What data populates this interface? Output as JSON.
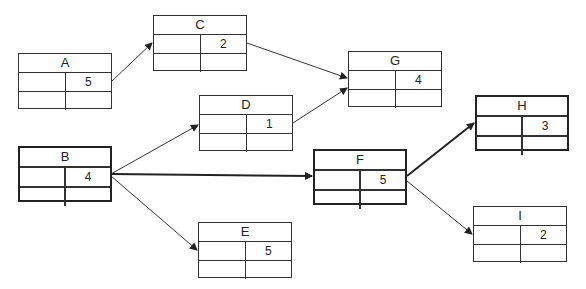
{
  "nodes": {
    "A": {
      "label": "A",
      "duration": "5"
    },
    "B": {
      "label": "B",
      "duration": "4"
    },
    "C": {
      "label": "C",
      "duration": "2"
    },
    "D": {
      "label": "D",
      "duration": "1"
    },
    "E": {
      "label": "E",
      "duration": "5"
    },
    "F": {
      "label": "F",
      "duration": "5"
    },
    "G": {
      "label": "G",
      "duration": "4"
    },
    "H": {
      "label": "H",
      "duration": "3"
    },
    "I": {
      "label": "I",
      "duration": "2"
    }
  },
  "edges": [
    {
      "from": "A",
      "to": "C"
    },
    {
      "from": "C",
      "to": "G"
    },
    {
      "from": "D",
      "to": "G"
    },
    {
      "from": "B",
      "to": "D"
    },
    {
      "from": "B",
      "to": "F",
      "critical": true
    },
    {
      "from": "B",
      "to": "E"
    },
    {
      "from": "F",
      "to": "H",
      "critical": true
    },
    {
      "from": "F",
      "to": "I"
    }
  ],
  "colors": {
    "line": "#222222",
    "background": "#ffffff"
  }
}
